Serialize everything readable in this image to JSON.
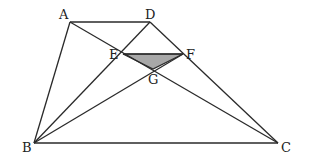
{
  "diagram": {
    "type": "geometry-trapezoid",
    "colors": {
      "line": "#2a2a2a",
      "shade": "#a8a8a8",
      "background": "#ffffff"
    },
    "points": {
      "A": {
        "label": "A",
        "x": 70,
        "y": 22
      },
      "D": {
        "label": "D",
        "x": 150,
        "y": 22
      },
      "E": {
        "label": "E",
        "x": 123,
        "y": 54
      },
      "F": {
        "label": "F",
        "x": 183,
        "y": 54
      },
      "G": {
        "label": "G",
        "x": 153,
        "y": 69
      },
      "B": {
        "label": "B",
        "x": 34,
        "y": 143
      },
      "C": {
        "label": "C",
        "x": 278,
        "y": 143
      }
    },
    "segments": [
      "AD",
      "AB",
      "BC",
      "DC",
      "AC",
      "BD",
      "BF",
      "EF"
    ],
    "shaded_region": [
      "E",
      "F",
      "G"
    ]
  }
}
